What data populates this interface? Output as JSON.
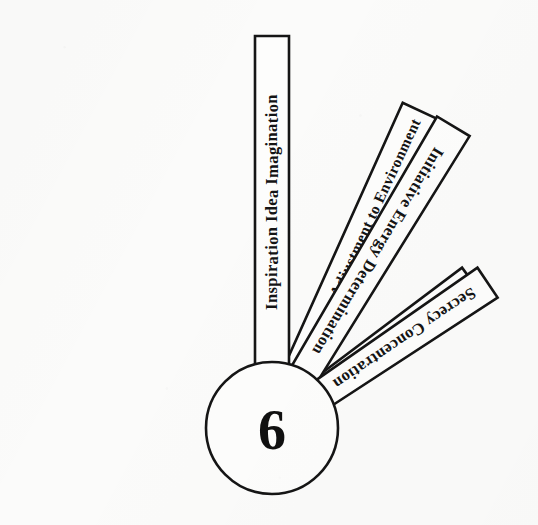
{
  "figure": {
    "background_color": "#fbfbfa",
    "ink_color": "#151515"
  },
  "hub": {
    "number": "6",
    "center_x": 272,
    "center_y": 428,
    "radius": 66
  },
  "blades": [
    {
      "id": "judgement-tact-art",
      "label": "Judgement  Tact   Art",
      "angle_deg": -36,
      "inner_radius": 62,
      "outer_radius": 248,
      "width_inner": 30,
      "width_outer": 36,
      "text_flip": false
    },
    {
      "id": "wholeness-adjustment-to-environment",
      "label": "Wholeness Adjustment to Environment",
      "angle_deg": -65,
      "inner_radius": 62,
      "outer_radius": 350,
      "width_inner": 30,
      "width_outer": 38,
      "text_flip": false
    },
    {
      "id": "inspiration-idea-imagination",
      "label": "Inspiration Idea Imagination",
      "angle_deg": -90,
      "inner_radius": 62,
      "outer_radius": 392,
      "width_inner": 34,
      "width_outer": 34,
      "text_flip": false
    },
    {
      "id": "initiative-energy-determination",
      "label": "Initiative Energy Determination",
      "angle_deg": -59,
      "inner_radius": 62,
      "outer_radius": 352,
      "width_inner": 30,
      "width_outer": 38,
      "text_flip": true
    },
    {
      "id": "secrecy-concentration",
      "label": "Secrecy Concentration",
      "angle_deg": -34,
      "inner_radius": 62,
      "outer_radius": 260,
      "width_inner": 30,
      "width_outer": 36,
      "text_flip": true
    }
  ]
}
